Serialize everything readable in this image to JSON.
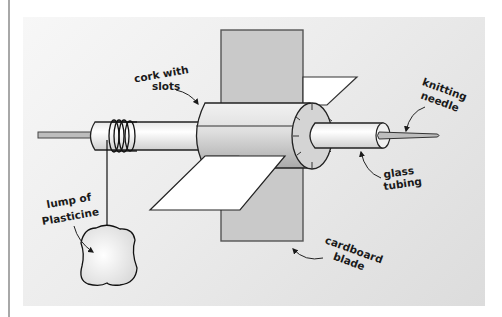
{
  "figure": {
    "type": "apparatus-diagram",
    "labels": {
      "cork": [
        "cork with",
        "slots"
      ],
      "needle": [
        "knitting",
        "needle"
      ],
      "tubing": [
        "glass",
        "tubing"
      ],
      "blade": [
        "cardboard",
        "blade"
      ],
      "plasticine": [
        "lump of",
        "Plasticine"
      ]
    },
    "colors": {
      "background_light": "#f7f7f7",
      "background_dark": "#dcdcdc",
      "cardboard": "#c8c8c8",
      "cork": "#cfcfcf",
      "tube": "#f4f4f4",
      "outline": "#1a1a1a",
      "side_rule": "#a8a8a8"
    }
  }
}
